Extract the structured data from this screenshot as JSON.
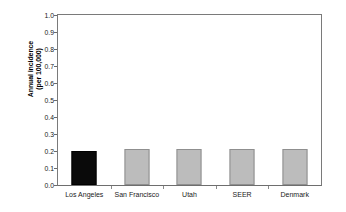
{
  "chart_data": {
    "type": "bar",
    "title": "",
    "subtitle": "",
    "xlabel": "",
    "ylabel_line1": "Annual incidence",
    "ylabel_line2": "(per 100,000)",
    "categories": [
      "Los Angeles",
      "San Francisco",
      "Utah",
      "SEER",
      "Denmark"
    ],
    "values": [
      0.2,
      0.21,
      0.21,
      0.21,
      0.21
    ],
    "series": [
      {
        "name": "Annual incidence (per 100,000)",
        "values": [
          0.2,
          0.21,
          0.21,
          0.21,
          0.21
        ]
      }
    ],
    "bar_colors": [
      "#0a0a0a",
      "#bcbcbc",
      "#bcbcbc",
      "#bcbcbc",
      "#bcbcbc"
    ],
    "bar_edge_colors": [
      "#000000",
      "#8f8f8f",
      "#8f8f8f",
      "#8f8f8f",
      "#8f8f8f"
    ],
    "highlighted_category": "Los Angeles",
    "ylim": [
      0.0,
      1.0
    ],
    "ytick_values": [
      0.0,
      0.1,
      0.2,
      0.3,
      0.4,
      0.5,
      0.6,
      0.7,
      0.8,
      0.9,
      1.0
    ],
    "ytick_labels": [
      "0.0",
      "0.1",
      "0.2",
      "0.3",
      "0.4",
      "0.5",
      "0.6",
      "0.7",
      "0.8",
      "0.9",
      "1.0"
    ],
    "grid": false,
    "legend": false,
    "legend_position": "none",
    "frame_color": "#7a7a7a",
    "background_color": "#ffffff",
    "annotations": []
  }
}
